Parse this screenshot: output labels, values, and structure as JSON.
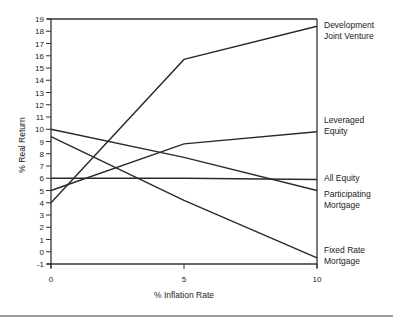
{
  "chart_data": {
    "type": "line",
    "title": "",
    "xlabel": "% Inflation Rate",
    "ylabel": "% Real Return",
    "x": [
      0,
      5,
      10
    ],
    "x_ticks": [
      "0",
      "5",
      "10"
    ],
    "xlim": [
      0,
      10
    ],
    "y_ticks": [
      "-1",
      "0",
      "1",
      "2",
      "3",
      "4",
      "5",
      "6",
      "7",
      "8",
      "9",
      "10",
      "11",
      "12",
      "13",
      "14",
      "15",
      "16",
      "17",
      "18",
      "19"
    ],
    "ylim": [
      -1,
      19
    ],
    "grid": false,
    "legend": "right-side inline labels",
    "series": [
      {
        "name": "Development Joint Venture",
        "label_lines": [
          "Development",
          "Joint Venture"
        ],
        "values": [
          4,
          15.7,
          18.4
        ]
      },
      {
        "name": "Leveraged Equity",
        "label_lines": [
          "Leveraged",
          "Equity"
        ],
        "values": [
          5,
          8.8,
          9.8
        ]
      },
      {
        "name": "All Equity",
        "label_lines": [
          "All Equity"
        ],
        "values": [
          6,
          6,
          5.9
        ]
      },
      {
        "name": "Participating Mortgage",
        "label_lines": [
          "Participating",
          "Mortgage"
        ],
        "values": [
          10,
          7.7,
          5.0
        ]
      },
      {
        "name": "Fixed Rate Mortgage",
        "label_lines": [
          "Fixed Rate",
          "Mortgage"
        ],
        "values": [
          9.4,
          4.2,
          -0.5
        ]
      }
    ]
  }
}
